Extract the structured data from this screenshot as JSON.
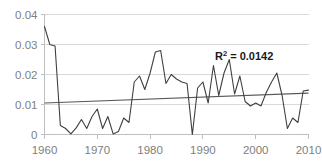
{
  "chart_data": {
    "type": "line",
    "title": "",
    "xlabel": "",
    "ylabel": "",
    "xlim": [
      1960,
      2010
    ],
    "ylim": [
      0,
      0.04
    ],
    "grid": true,
    "legend": false,
    "x_ticks": [
      "1960",
      "1970",
      "1980",
      "1990",
      "2000",
      "2010"
    ],
    "x_tick_values": [
      1960,
      1970,
      1980,
      1990,
      2000,
      2010
    ],
    "y_ticks": [
      "0",
      "0.01",
      "0.02",
      "0.03",
      "0.04"
    ],
    "y_tick_values": [
      0,
      0.01,
      0.02,
      0.03,
      0.04
    ],
    "annotations": [
      {
        "name": "r-squared",
        "text_prefix": "R",
        "text_sup": "2",
        "text_suffix": " = 0.0142",
        "full_text": "R² = 0.0142",
        "value": 0.0142
      }
    ],
    "series": [
      {
        "name": "data",
        "color": "#404040",
        "x": [
          1960,
          1961,
          1962,
          1963,
          1964,
          1965,
          1966,
          1967,
          1968,
          1969,
          1970,
          1971,
          1972,
          1973,
          1974,
          1975,
          1976,
          1977,
          1978,
          1979,
          1980,
          1981,
          1982,
          1983,
          1984,
          1985,
          1986,
          1987,
          1988,
          1989,
          1990,
          1991,
          1992,
          1993,
          1994,
          1995,
          1996,
          1997,
          1998,
          1999,
          2000,
          2001,
          2002,
          2003,
          2004,
          2005,
          2006,
          2007,
          2008,
          2009,
          2010
        ],
        "values": [
          0.036,
          0.03,
          0.0295,
          0.003,
          0.002,
          0.0002,
          0.0022,
          0.005,
          0.002,
          0.006,
          0.0085,
          0.002,
          0.006,
          0.0002,
          0.001,
          0.0055,
          0.004,
          0.0175,
          0.0195,
          0.015,
          0.0205,
          0.0275,
          0.028,
          0.017,
          0.02,
          0.0185,
          0.0175,
          0.017,
          0.0,
          0.0155,
          0.0175,
          0.0105,
          0.023,
          0.013,
          0.0205,
          0.025,
          0.0135,
          0.0195,
          0.011,
          0.0095,
          0.0105,
          0.0095,
          0.014,
          0.0175,
          0.0205,
          0.013,
          0.002,
          0.0055,
          0.004,
          0.0145,
          0.0148
        ]
      }
    ],
    "trendline": {
      "name": "linear-trend",
      "color": "#595959",
      "x": [
        1960,
        2010
      ],
      "values": [
        0.0105,
        0.0138
      ]
    }
  }
}
